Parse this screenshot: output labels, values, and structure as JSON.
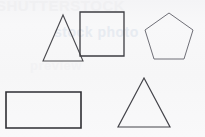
{
  "page": {
    "background_color": "#f7f7f8",
    "width": 205,
    "height": 137
  },
  "watermark": {
    "line_top": "SHUTTERSTOCK",
    "line_mid": "stock photo",
    "line_low": "preview",
    "color_top": "#f0f0f2",
    "color_mid": "#e7ebf1",
    "color_low": "#f2f2f4"
  },
  "shapes": [
    {
      "id": "triangle-top-left",
      "name": "triangle",
      "label": "Triangle",
      "sides": 3,
      "stroke_color": "#4a4a4f",
      "stroke_width": 1.1,
      "fill": "none",
      "points": "25,50 45,4 65,50",
      "box": {
        "x": 18,
        "y": 11,
        "width": 54,
        "height": 54
      }
    },
    {
      "id": "square-top-middle",
      "name": "square",
      "label": "Square",
      "sides": 4,
      "stroke_color": "#3c3c41",
      "stroke_width": 1.3,
      "fill": "none",
      "points": "1,1 45,1 45,45 1,45",
      "box": {
        "x": 79,
        "y": 11,
        "width": 47,
        "height": 48
      }
    },
    {
      "id": "pentagon-top-right",
      "name": "pentagon",
      "label": "Pentagon",
      "sides": 5,
      "stroke_color": "#6f6f77",
      "stroke_width": 1.0,
      "fill": "none",
      "points": "25,1 49,18 40,47 10,47 1,18",
      "box": {
        "x": 144,
        "y": 12,
        "width": 52,
        "height": 50
      }
    },
    {
      "id": "rectangle-bottom-left",
      "name": "rectangle",
      "label": "Rectangle",
      "sides": 4,
      "stroke_color": "#2e2e33",
      "stroke_width": 1.6,
      "fill": "none",
      "points": "1,1 76,1 76,37 1,37",
      "box": {
        "x": 5,
        "y": 91,
        "width": 80,
        "height": 41
      }
    },
    {
      "id": "triangle-bottom-right",
      "name": "triangle",
      "label": "Triangle",
      "sides": 3,
      "stroke_color": "#44444a",
      "stroke_width": 1.2,
      "fill": "none",
      "points": "27,1 53,50 1,50",
      "box": {
        "x": 117,
        "y": 77,
        "width": 56,
        "height": 53
      }
    }
  ]
}
